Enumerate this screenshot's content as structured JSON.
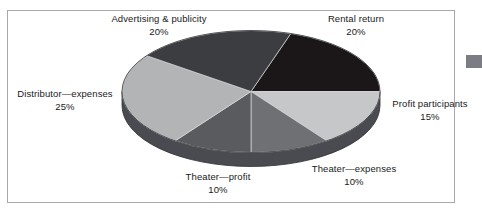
{
  "figure": {
    "border_color": "#a8a8ac",
    "background": "#ffffff",
    "side_tab_color": "#7c7c85"
  },
  "chart_data": {
    "type": "pie",
    "title": "",
    "subtitle": "",
    "xlabel": "",
    "ylabel": "",
    "legend_position": "none",
    "grid": false,
    "style": "3d-exploded-none",
    "total": 100,
    "units": "%",
    "labels": [
      "Rental return",
      "Profit participants",
      "Theater—expenses",
      "Theater—profit",
      "Distributor—expenses",
      "Advertising & publicity"
    ],
    "values": [
      20,
      15,
      10,
      10,
      25,
      20
    ],
    "value_labels": [
      "20%",
      "15%",
      "10%",
      "10%",
      "25%",
      "20%"
    ],
    "colors": [
      "#1b1617",
      "#c6c7c9",
      "#6e7074",
      "#595b5f",
      "#b3b4b6",
      "#3c3d41"
    ],
    "side_color": "#4a4b50",
    "slices": [
      {
        "name": "Rental return",
        "value": 20,
        "value_label": "20%",
        "color": "#1b1617"
      },
      {
        "name": "Profit participants",
        "value": 15,
        "value_label": "15%",
        "color": "#c6c7c9"
      },
      {
        "name": "Theater—expenses",
        "value": 10,
        "value_label": "10%",
        "color": "#6e7074"
      },
      {
        "name": "Theater—profit",
        "value": 10,
        "value_label": "10%",
        "color": "#595b5f"
      },
      {
        "name": "Distributor—expenses",
        "value": 25,
        "value_label": "25%",
        "color": "#b3b4b6"
      },
      {
        "name": "Advertising & publicity",
        "value": 20,
        "value_label": "20%",
        "color": "#3c3d41"
      }
    ]
  },
  "labels": {
    "advertising": {
      "name": "Advertising & publicity",
      "value": "20%"
    },
    "rental": {
      "name": "Rental return",
      "value": "20%"
    },
    "distributor": {
      "name": "Distributor—expenses",
      "value": "25%"
    },
    "profit_participants": {
      "name": "Profit participants",
      "value": "15%"
    },
    "theater_profit": {
      "name": "Theater—profit",
      "value": "10%"
    },
    "theater_expenses": {
      "name": "Theater—expenses",
      "value": "10%"
    }
  }
}
